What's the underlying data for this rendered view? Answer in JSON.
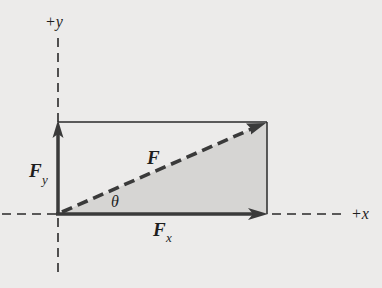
{
  "diagram": {
    "type": "vector-components",
    "colors": {
      "background": "#ecebea",
      "ink": "#2a2a2a",
      "vector": "#3a3a3a",
      "shade": "#d6d5d3"
    },
    "axes": {
      "x_label": "+x",
      "y_label": "+y"
    },
    "vectors": {
      "resultant": {
        "label": "F",
        "style": "dashed"
      },
      "x_component": {
        "label": "F",
        "subscript": "x",
        "style": "solid"
      },
      "y_component": {
        "label": "F",
        "subscript": "y",
        "style": "solid"
      }
    },
    "angle": {
      "label": "θ"
    }
  }
}
